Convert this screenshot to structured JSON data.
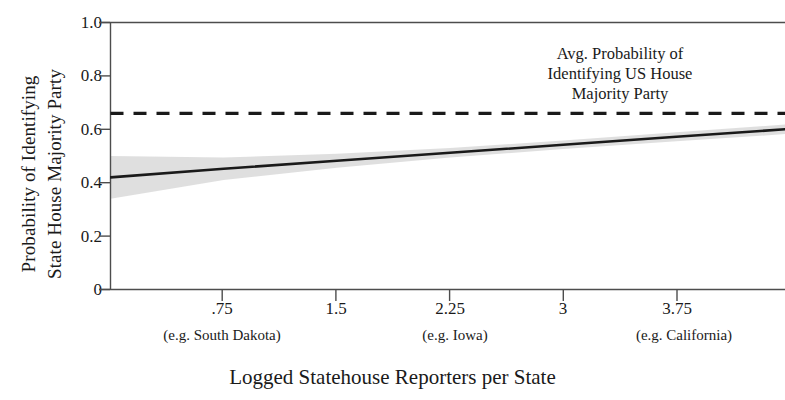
{
  "axis_titles": {
    "y_line1": "Probability of Identifying",
    "y_line2": "State House Majority Party",
    "x": "Logged Statehouse Reporters per State"
  },
  "annotation": {
    "line1": "Avg. Probability of",
    "line2": "Identifying US House",
    "line3": "Majority Party"
  },
  "x_sublabels": [
    {
      "text": "(e.g. South Dakota)",
      "at": 0.75
    },
    {
      "text": "(e.g. Iowa)",
      "at": 2.25
    },
    {
      "text": "(e.g. California)",
      "at": 3.75
    }
  ],
  "colors": {
    "line": "#1a1a1a",
    "band": "#d9d9d9",
    "axis": "#4d4d4d",
    "text": "#1a1a1a"
  },
  "chart_data": {
    "type": "line",
    "title": "",
    "xlabel": "Logged Statehouse Reporters per State",
    "ylabel": "Probability of Identifying State House Majority Party",
    "xlim": [
      0,
      4.47
    ],
    "ylim": [
      0,
      1.0
    ],
    "grid": false,
    "legend": "none",
    "x_ticks": [
      0.75,
      1.5,
      2.25,
      3,
      3.75
    ],
    "x_tick_labels": [
      ".75",
      "1.5",
      "2.25",
      "3",
      "3.75"
    ],
    "y_ticks": [
      0,
      0.2,
      0.4,
      0.6,
      0.8,
      1.0
    ],
    "y_tick_labels": [
      "0",
      "0.2",
      "0.4",
      "0.6",
      "0.8",
      "1.0"
    ],
    "series": [
      {
        "name": "Predicted probability of identifying state house majority party",
        "style": "solid",
        "x": [
          0,
          0.75,
          1.5,
          2.25,
          3,
          3.75,
          4.47
        ],
        "values": [
          0.42,
          0.452,
          0.482,
          0.512,
          0.542,
          0.572,
          0.6
        ]
      },
      {
        "name": "Avg. Probability of Identifying US House Majority Party",
        "style": "dashed",
        "x": [
          0,
          4.47
        ],
        "values": [
          0.66,
          0.66
        ]
      }
    ],
    "confidence_band": {
      "name": "95% confidence interval",
      "x": [
        0,
        0.75,
        1.5,
        2.25,
        3,
        3.75,
        4.47
      ],
      "upper": [
        0.5,
        0.494,
        0.508,
        0.53,
        0.558,
        0.589,
        0.618
      ],
      "lower": [
        0.34,
        0.41,
        0.456,
        0.494,
        0.526,
        0.555,
        0.582
      ]
    },
    "annotations": [
      {
        "text": "Avg. Probability of Identifying US House Majority Party",
        "x": 2.73,
        "y": 0.8
      }
    ]
  }
}
